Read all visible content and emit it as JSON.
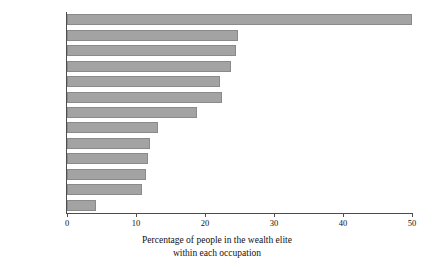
{
  "chart_data": {
    "type": "bar",
    "orientation": "horizontal",
    "title": "",
    "subtitle": "",
    "xlabel_line1": "Percentage of people in the wealth elite",
    "xlabel_line2": "within each occupation",
    "ylabel": "",
    "categories": [
      "Business",
      "Aristocracy",
      "Law",
      "Media",
      "Society",
      "Sport",
      "Creative",
      "Science",
      "Medicine",
      "Education",
      "Government",
      "Military",
      "Religion"
    ],
    "values": [
      50.0,
      24.8,
      24.5,
      23.8,
      22.2,
      22.5,
      18.8,
      13.2,
      12.0,
      11.7,
      11.4,
      10.9,
      4.2
    ],
    "xlim": [
      0,
      50
    ],
    "xticks": [
      0,
      10,
      20,
      30,
      40,
      50
    ],
    "xtick_labels": [
      "0",
      "10",
      "20",
      "30",
      "40",
      "50"
    ],
    "grid": false,
    "legend": false,
    "bar_color": "#a3a3a3",
    "bar_edge_color": "#8a8a8a",
    "axis_color": "#4d4d4d",
    "text_color": "#111111",
    "background": "#ffffff"
  }
}
